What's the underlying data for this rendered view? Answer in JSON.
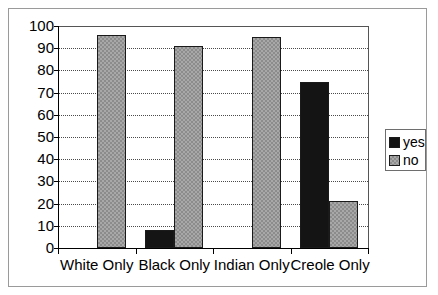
{
  "chart_data": {
    "type": "bar",
    "title": "",
    "subtitle": "",
    "xlabel": "",
    "ylabel": "",
    "categories": [
      "White Only",
      "Black Only",
      "Indian Only",
      "Creole Only"
    ],
    "series": [
      {
        "name": "yes",
        "color": "#141414",
        "values": [
          0,
          8,
          0,
          75
        ]
      },
      {
        "name": "no",
        "color": "#a8a8a8",
        "values": [
          96,
          91,
          95,
          21
        ]
      }
    ],
    "ylim": [
      0,
      100
    ],
    "yticks": [
      0,
      10,
      20,
      30,
      40,
      50,
      60,
      70,
      80,
      90,
      100
    ],
    "ytick_labels": [
      "0",
      "10",
      "20",
      "30",
      "40",
      "50",
      "60",
      "70",
      "80",
      "90",
      "100"
    ],
    "grid": true,
    "grid_axis": "y",
    "grid_style": "dotted",
    "legend": [
      "yes",
      "no"
    ],
    "legend_position": "right",
    "bar_mode": "grouped",
    "frame": true
  },
  "legend": {
    "items": [
      {
        "label": "yes",
        "swatch": "black-square-swatch"
      },
      {
        "label": "no",
        "swatch": "gray-hatched-square-swatch"
      }
    ]
  }
}
